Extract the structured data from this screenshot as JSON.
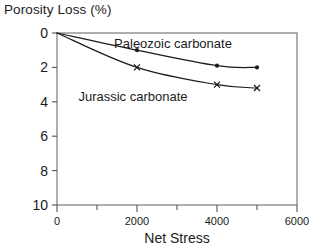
{
  "chart_data": {
    "type": "line",
    "title": "Porosity Loss (%)",
    "xlabel": "Net Stress",
    "ylabel": "Porosity Loss (%)",
    "xlim": [
      0,
      6000
    ],
    "ylim": [
      0,
      10
    ],
    "y_inverted": true,
    "grid": false,
    "legend_position": "inline-annotations",
    "x_ticks": [
      0,
      1000,
      2000,
      3000,
      4000,
      5000,
      6000
    ],
    "x_tick_labels": [
      "0",
      "",
      "2000",
      "",
      "4000",
      "",
      "6000"
    ],
    "x_major_labels": [
      "0",
      "2000",
      "4000",
      "6000"
    ],
    "y_ticks": [
      0,
      2,
      4,
      6,
      8,
      10
    ],
    "y_tick_labels": [
      "0",
      "2",
      "4",
      "6",
      "8",
      "10"
    ],
    "series": [
      {
        "name": "Paleozoic carbonate",
        "marker": "filled-circle",
        "x": [
          0,
          2000,
          4000,
          5000
        ],
        "values": [
          0,
          1.0,
          1.9,
          2.0
        ]
      },
      {
        "name": "Jurassic carbonate",
        "marker": "cross",
        "x": [
          0,
          2000,
          4000,
          5000
        ],
        "values": [
          0,
          2.0,
          3.0,
          3.2
        ]
      }
    ],
    "annotations": [
      {
        "text": "Paleozoic carbonate",
        "x": 2900,
        "y": 0.85
      },
      {
        "text": "Jurassic carbonate",
        "x": 1900,
        "y": 3.95
      }
    ],
    "colors": {
      "line": "#1b1b1b",
      "marker": "#1b1b1b",
      "axis": "#555555",
      "background": "#ffffff"
    }
  }
}
